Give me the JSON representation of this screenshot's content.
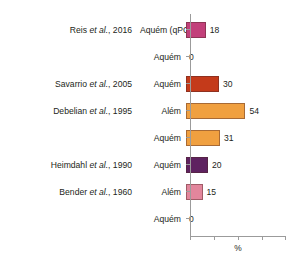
{
  "chart_data": {
    "type": "bar",
    "orientation": "horizontal",
    "title": "",
    "xlabel": "%",
    "ylabel": "",
    "xlim": [
      0,
      87
    ],
    "grid": false,
    "legend": null,
    "axis_ticks": {
      "x": [
        "",
        "",
        "",
        "",
        ""
      ]
    },
    "categories": [
      "Aquém (qPCR)",
      "Aquém",
      "Aquém",
      "Além",
      "Aquém",
      "Aquém",
      "Além",
      "Aquém"
    ],
    "values": [
      18,
      0,
      30,
      54,
      31,
      20,
      15,
      0
    ],
    "value_labels": [
      "18",
      "0",
      "30",
      "54",
      "31",
      "20",
      "15",
      "0"
    ],
    "bar_colors": [
      "#C2407A",
      "#C2407A",
      "#C43A1A",
      "#F0A040",
      "#F0A040",
      "#5E2260",
      "#E2869C",
      "#E2869C"
    ],
    "study_labels": [
      "Reis et al., 2016",
      "",
      "Savarrio et al., 2005",
      "Debelian et al., 1995",
      "",
      "Heimdahl et al., 1990",
      "Bender et al., 1960",
      ""
    ],
    "study_label_parts": [
      {
        "author": "Reis ",
        "italic": "et al.",
        "year": ", 2016"
      },
      {
        "author": "",
        "italic": "",
        "year": ""
      },
      {
        "author": "Savarrio ",
        "italic": "et al.",
        "year": ", 2005"
      },
      {
        "author": "Debelian ",
        "italic": "et al.",
        "year": ", 1995"
      },
      {
        "author": "",
        "italic": "",
        "year": ""
      },
      {
        "author": "Heimdahl ",
        "italic": "et al.",
        "year": ", 1990"
      },
      {
        "author": "Bender ",
        "italic": "et al.",
        "year": ", 1960"
      },
      {
        "author": "",
        "italic": "",
        "year": ""
      }
    ]
  },
  "axis": {
    "x_title": "%",
    "axis_color": "#9b9b9b"
  }
}
